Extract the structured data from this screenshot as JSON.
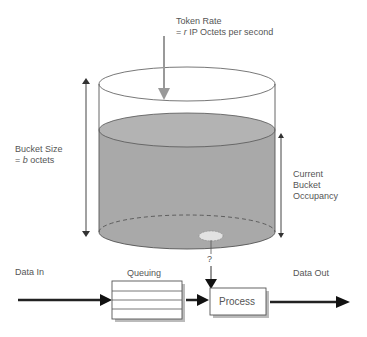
{
  "diagram": {
    "token_rate": {
      "line1": "Token Rate",
      "line2_prefix": "= ",
      "line2_var": "r",
      "line2_suffix": " IP Octets per second"
    },
    "bucket_size": {
      "line1": "Bucket Size",
      "line2_prefix": "= ",
      "line2_var": "b",
      "line2_suffix": " octets"
    },
    "occupancy": {
      "line1": "Current",
      "line2": "Bucket",
      "line3": "Occupancy"
    },
    "data_in": "Data In",
    "queuing": "Queuing",
    "process": "Process",
    "data_out": "Data Out",
    "question_mark": "?",
    "colors": {
      "fill": "#a9a9a9",
      "fill_top": "#b3b3b3",
      "line": "#444444",
      "arrow_gray": "#999999",
      "hole": "#e2e2e2"
    }
  }
}
